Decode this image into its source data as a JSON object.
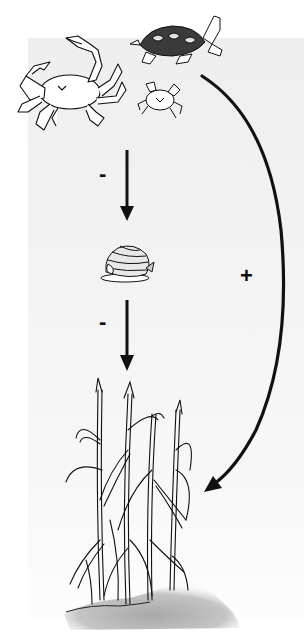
{
  "diagram": {
    "type": "trophic-cascade",
    "nodes": [
      {
        "id": "predators",
        "label": "",
        "icons": [
          "blue-crab",
          "diamondback-terrapin",
          "mud-crab"
        ]
      },
      {
        "id": "grazer",
        "label": "",
        "icons": [
          "periwinkle-snail"
        ]
      },
      {
        "id": "plant",
        "label": "",
        "icons": [
          "marsh-cordgrass"
        ]
      }
    ],
    "edges": [
      {
        "from": "predators",
        "to": "grazer",
        "sign": "-"
      },
      {
        "from": "grazer",
        "to": "plant",
        "sign": "-"
      },
      {
        "from": "predators",
        "to": "plant",
        "sign": "+",
        "style": "curved"
      }
    ],
    "signs": {
      "predator_to_grazer": "-",
      "grazer_to_plant": "-",
      "predator_to_plant": "+"
    },
    "colors": {
      "line": "#111111",
      "background": "#f2f2f2",
      "sediment": "#c8c8c8"
    }
  }
}
